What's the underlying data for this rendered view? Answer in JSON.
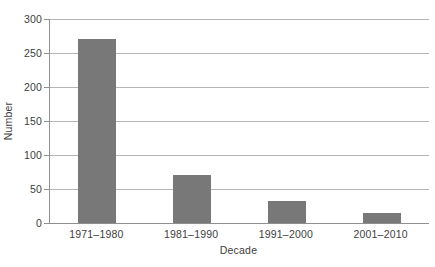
{
  "chart_data": {
    "type": "bar",
    "categories": [
      "1971–1980",
      "1981–1990",
      "1991–2000",
      "2001–2010"
    ],
    "values": [
      270,
      70,
      33,
      15
    ],
    "xlabel": "Decade",
    "ylabel": "Number",
    "ylim": [
      0,
      300
    ],
    "yticks": [
      0,
      50,
      100,
      150,
      200,
      250,
      300
    ],
    "grid": "horizontal",
    "legend": "none",
    "colors": {
      "bar_fill": "#787878",
      "gridline": "#b5b5b5",
      "axis_line": "#8f8f8f",
      "text": "#3d3d3d",
      "background": "#ffffff"
    }
  }
}
